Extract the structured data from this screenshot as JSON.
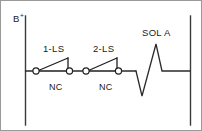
{
  "diagram": {
    "type": "ladder-diagram",
    "supply_rail": {
      "label": "B",
      "polarity": "+"
    },
    "rungs": [
      {
        "devices": [
          {
            "kind": "contact",
            "name": "limit-switch-1",
            "tag": "1-LS",
            "contact_type": "NC",
            "state": "closed"
          },
          {
            "kind": "contact",
            "name": "limit-switch-2",
            "tag": "2-LS",
            "contact_type": "NC",
            "state": "closed"
          },
          {
            "kind": "coil",
            "name": "solenoid-a",
            "tag": "SOL A",
            "symbol": "zigzag-coil"
          }
        ]
      }
    ],
    "labels": {
      "contact1_tag": "1-LS",
      "contact1_type": "NC",
      "contact2_tag": "2-LS",
      "contact2_type": "NC",
      "coil_tag": "SOL A"
    },
    "colors": {
      "line": "#2b2b2b",
      "rail": "#3a3a3a",
      "border": "#9a9a9a",
      "background": "#ffffff",
      "text": "#1a1a1a"
    }
  }
}
